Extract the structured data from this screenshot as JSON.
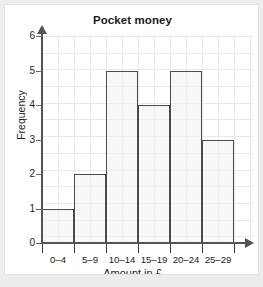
{
  "card": {
    "background_color": "#ffffff",
    "page_background_color": "#eceded",
    "border_color": "#e2e2e2"
  },
  "chart_data": {
    "type": "bar",
    "title": "Pocket money",
    "xlabel": "Amount in £",
    "ylabel": "Frequency",
    "categories": [
      "0–4",
      "5–9",
      "10–14",
      "15–19",
      "20–24",
      "25–29"
    ],
    "values": [
      1,
      2,
      5,
      4,
      5,
      3
    ],
    "ylim": [
      0,
      6
    ],
    "ytick_labels": [
      "0",
      "1",
      "2",
      "3",
      "4",
      "5",
      "6"
    ],
    "ytick_values": [
      0,
      1,
      2,
      3,
      4,
      5,
      6
    ],
    "grid": true,
    "legend": null,
    "bar_fill_color": "#f2f2f2",
    "bar_border_color": "#4a4a4a",
    "axis_color": "#545454",
    "grid_color": "#e9eaec",
    "histogram_contiguous_bars": true
  }
}
